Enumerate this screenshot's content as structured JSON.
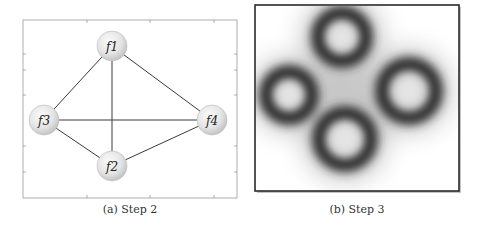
{
  "figure": {
    "subfigures": [
      {
        "id": "a",
        "caption": "(a) Step 2",
        "type": "graph",
        "nodes": [
          {
            "id": "f1",
            "label": "f1",
            "x": 112,
            "y": 46
          },
          {
            "id": "f2",
            "label": "f2",
            "x": 112,
            "y": 166
          },
          {
            "id": "f3",
            "label": "f3",
            "x": 44,
            "y": 120
          },
          {
            "id": "f4",
            "label": "f4",
            "x": 212,
            "y": 120
          }
        ],
        "edges": [
          [
            "f1",
            "f3"
          ],
          [
            "f1",
            "f4"
          ],
          [
            "f1",
            "f2"
          ],
          [
            "f3",
            "f4"
          ],
          [
            "f3",
            "f2"
          ],
          [
            "f2",
            "f4"
          ]
        ]
      },
      {
        "id": "b",
        "caption": "(b) Step 3",
        "type": "density-map",
        "rings": [
          {
            "id": "top",
            "x": 342,
            "y": 37,
            "inner_r": 17,
            "outer_r": 34
          },
          {
            "id": "left",
            "x": 289,
            "y": 95,
            "inner_r": 16,
            "outer_r": 32
          },
          {
            "id": "right",
            "x": 409,
            "y": 91,
            "inner_r": 19,
            "outer_r": 36
          },
          {
            "id": "bottom",
            "x": 345,
            "y": 139,
            "inner_r": 19,
            "outer_r": 36
          }
        ]
      }
    ]
  }
}
